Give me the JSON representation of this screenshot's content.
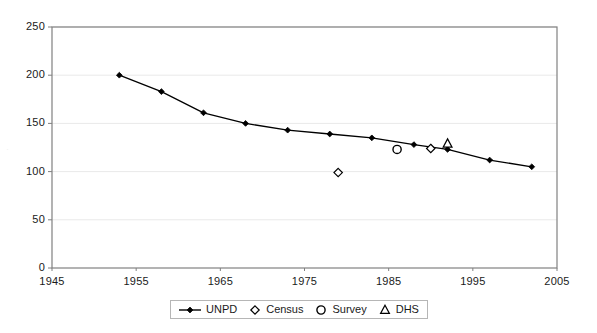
{
  "chart_data": {
    "type": "line",
    "title": "",
    "xlabel": "",
    "ylabel": "",
    "xlim": [
      1945,
      2005
    ],
    "ylim": [
      0,
      250
    ],
    "xticks": [
      1945,
      1955,
      1965,
      1975,
      1985,
      1995,
      2005
    ],
    "yticks": [
      0,
      50,
      100,
      150,
      200,
      250
    ],
    "xtick_labels": [
      "1945",
      "1955",
      "1965",
      "1975",
      "1985",
      "1995",
      "2005"
    ],
    "ytick_labels": [
      "0",
      "50",
      "100",
      "150",
      "200",
      "250"
    ],
    "grid": "horizontal",
    "legend_position": "bottom",
    "series": [
      {
        "name": "UNPD",
        "marker": "filled-diamond",
        "line": true,
        "color": "#000000",
        "points": [
          {
            "x": 1953,
            "y": 200
          },
          {
            "x": 1958,
            "y": 183
          },
          {
            "x": 1963,
            "y": 161
          },
          {
            "x": 1968,
            "y": 150
          },
          {
            "x": 1973,
            "y": 143
          },
          {
            "x": 1978,
            "y": 139
          },
          {
            "x": 1983,
            "y": 135
          },
          {
            "x": 1988,
            "y": 128
          },
          {
            "x": 1992,
            "y": 123
          },
          {
            "x": 1997,
            "y": 112
          },
          {
            "x": 2002,
            "y": 105
          }
        ]
      },
      {
        "name": "Census",
        "marker": "open-diamond",
        "line": false,
        "color": "#000000",
        "points": [
          {
            "x": 1979,
            "y": 99
          },
          {
            "x": 1990,
            "y": 124
          }
        ]
      },
      {
        "name": "Survey",
        "marker": "open-circle",
        "line": false,
        "color": "#000000",
        "points": [
          {
            "x": 1986,
            "y": 123
          }
        ]
      },
      {
        "name": "DHS",
        "marker": "open-triangle",
        "line": false,
        "color": "#000000",
        "points": [
          {
            "x": 1992,
            "y": 129
          }
        ]
      }
    ]
  },
  "legend": {
    "items": [
      {
        "label": "UNPD",
        "marker": "filled-diamond-line",
        "icon_name": "legend-marker-unpd"
      },
      {
        "label": "Census",
        "marker": "open-diamond",
        "icon_name": "legend-marker-census"
      },
      {
        "label": "Survey",
        "marker": "open-circle",
        "icon_name": "legend-marker-survey"
      },
      {
        "label": "DHS",
        "marker": "open-triangle",
        "icon_name": "legend-marker-dhs"
      }
    ]
  },
  "colors": {
    "series": "#000000",
    "grid": "#e9e9e9",
    "axis": "#808080",
    "plot_background": "#ffffff",
    "legend_border": "#b6b6b6",
    "text": "#1a1a1a"
  }
}
